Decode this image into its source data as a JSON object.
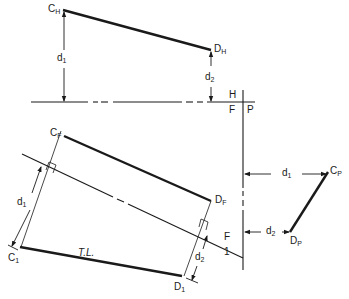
{
  "diagram": {
    "type": "descriptive-geometry-true-length",
    "points": {
      "CH": {
        "main": "C",
        "sub": "H"
      },
      "DH": {
        "main": "D",
        "sub": "H"
      },
      "CF": {
        "main": "C",
        "sub": "F"
      },
      "DF": {
        "main": "D",
        "sub": "F"
      },
      "C1": {
        "main": "C",
        "sub": "1"
      },
      "D1": {
        "main": "D",
        "sub": "1"
      },
      "CP": {
        "main": "C",
        "sub": "P"
      },
      "DP": {
        "main": "D",
        "sub": "P"
      }
    },
    "fold_lines": {
      "hf_top": "H",
      "hf_bottom": "F",
      "fp_right": "P",
      "f1_top": "F",
      "f1_bottom": "1"
    },
    "dimensions": {
      "d1_top": {
        "main": "d",
        "sub": "1"
      },
      "d2_top": {
        "main": "d",
        "sub": "2"
      },
      "d1_aux": {
        "main": "d",
        "sub": "1"
      },
      "d2_aux": {
        "main": "d",
        "sub": "2"
      },
      "d1_profile": {
        "main": "d",
        "sub": "1"
      },
      "d2_profile": {
        "main": "d",
        "sub": "2"
      }
    },
    "true_length_label": "T.L."
  }
}
